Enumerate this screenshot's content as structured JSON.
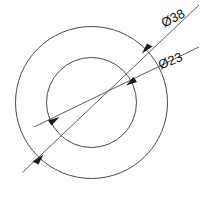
{
  "drawing": {
    "title": "Concentric circle dimension drawing",
    "background_color": "#ffffff",
    "line_color": "#4a4a4a",
    "text_color": "#111111",
    "center": {
      "x": 91.5,
      "y": 102.5
    },
    "circles": [
      {
        "name": "outer-circle",
        "diameter_label": "Ø38",
        "radius_px": 76
      },
      {
        "name": "inner-circle",
        "diameter_label": "Ø23",
        "radius_px": 45
      }
    ],
    "dimensions": [
      {
        "id": "outer",
        "label": "Ø38",
        "value": 38,
        "symbol": "Ø",
        "label_x": 175,
        "label_y": 22,
        "label_rotation": -28
      },
      {
        "id": "inner",
        "label": "Ø23",
        "value": 23,
        "symbol": "Ø",
        "label_x": 172,
        "label_y": 65,
        "label_rotation": -22
      }
    ]
  }
}
